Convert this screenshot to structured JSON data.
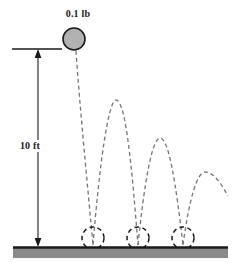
{
  "figure": {
    "background_color": "#ffffff"
  },
  "ball": {
    "label": "0.1 lb",
    "fill_color": "#b2b2b2",
    "stroke_color": "#1a1a1a",
    "center_x": 74,
    "center_y": 39,
    "radius": 11
  },
  "dimension": {
    "label": "10 ft",
    "value": 10,
    "unit": "ft",
    "line_color": "#1a1a1a",
    "top_y": 49,
    "bottom_y": 247,
    "x": 38
  },
  "reference_line": {
    "from_x": 12,
    "to_x": 62,
    "y": 49,
    "color": "#1a1a1a"
  },
  "ground": {
    "fill_color": "#8a8a8a",
    "edge_color": "#1a1a1a",
    "left_x": 13,
    "right_x": 228,
    "top_y": 247,
    "bottom_y": 258
  },
  "trajectory": {
    "stroke_color": "#767676",
    "dash_pattern": "4,3",
    "drop_path": "M 76 51 C 80 110, 88 190, 93 245",
    "arcs": [
      {
        "name": "bounce-arc-1",
        "path": "M 93 245 C 99 170, 108 100, 116 100 C 126 100, 132 170, 138 245",
        "peak_x": 116,
        "peak_y": 100
      },
      {
        "name": "bounce-arc-2",
        "path": "M 138 245 C 144 185, 152 138, 160 138 C 169 138, 176 185, 183 245",
        "peak_x": 160,
        "peak_y": 138
      },
      {
        "name": "bounce-arc-3",
        "path": "M 183 245 C 189 200, 197 172, 205 172 C 214 172, 222 185, 228 196",
        "peak_x": 205,
        "peak_y": 172
      }
    ]
  },
  "contact_circles": [
    {
      "name": "contact-circle-1",
      "center_x": 93,
      "center_y": 238,
      "radius": 11
    },
    {
      "name": "contact-circle-2",
      "center_x": 138,
      "center_y": 238,
      "radius": 11
    },
    {
      "name": "contact-circle-3",
      "center_x": 183,
      "center_y": 238,
      "radius": 11
    }
  ]
}
